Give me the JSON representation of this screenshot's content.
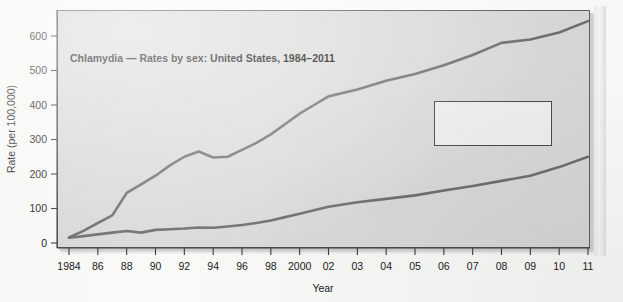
{
  "chart_data": {
    "type": "line",
    "title": "Chlamydia — Rates by sex: United States, 1984–2011",
    "xlabel": "Year",
    "ylabel": "Rate (per 100,000)",
    "ylim": [
      0,
      650
    ],
    "yticks": [
      0,
      100,
      200,
      300,
      400,
      500,
      600
    ],
    "ytick_labels": [
      "0",
      "100",
      "200",
      "300",
      "400",
      "500",
      "600"
    ],
    "grid": false,
    "legend_position": "center-right",
    "x": [
      1984,
      1986,
      1988,
      1990,
      1992,
      1994,
      1996,
      1998,
      2000,
      2002,
      2003,
      2004,
      2005,
      2006,
      2007,
      2008,
      2009,
      2010,
      2011
    ],
    "xtick_labels": [
      "1984",
      "86",
      "88",
      "90",
      "92",
      "94",
      "96",
      "98",
      "2000",
      "02",
      "03",
      "04",
      "05",
      "06",
      "07",
      "08",
      "09",
      "10",
      "11"
    ],
    "series": [
      {
        "name": "Women",
        "color": "#6e6e6e",
        "x": [
          1984,
          1985,
          1986,
          1987,
          1988,
          1989,
          1990,
          1991,
          1992,
          1993,
          1994,
          1995,
          1996,
          1997,
          1998,
          1999,
          2000,
          2001,
          2002,
          2003,
          2004,
          2005,
          2006,
          2007,
          2008,
          2009,
          2010,
          2011
        ],
        "values": [
          16,
          35,
          58,
          80,
          145,
          170,
          195,
          225,
          250,
          265,
          248,
          250,
          270,
          290,
          315,
          345,
          375,
          400,
          425,
          445,
          470,
          490,
          515,
          545,
          580,
          590,
          610,
          643
        ]
      },
      {
        "name": "Men",
        "color": "#6e6e6e",
        "x": [
          1984,
          1985,
          1986,
          1987,
          1988,
          1989,
          1990,
          1991,
          1992,
          1993,
          1994,
          1995,
          1996,
          1997,
          1998,
          1999,
          2000,
          2001,
          2002,
          2003,
          2004,
          2005,
          2006,
          2007,
          2008,
          2009,
          2010,
          2011
        ],
        "values": [
          15,
          20,
          25,
          30,
          35,
          30,
          38,
          40,
          42,
          45,
          44,
          48,
          52,
          58,
          65,
          75,
          85,
          95,
          105,
          118,
          128,
          138,
          152,
          165,
          180,
          195,
          220,
          250
        ]
      }
    ],
    "legend": [
      {
        "label": "Men"
      },
      {
        "label": "Women"
      }
    ]
  },
  "colors": {
    "line": "#6e6e6e",
    "axis": "#3a3a3a",
    "panel_bg": "#d8d8d7",
    "page_bg": "#f7f7f5",
    "legend_bg": "#ececeb"
  }
}
